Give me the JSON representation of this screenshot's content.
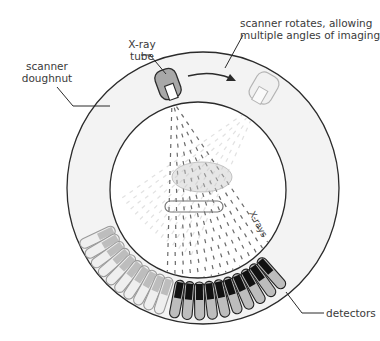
{
  "diagram": {
    "labels": {
      "xray_tube": [
        "X-ray",
        "tube"
      ],
      "scanner_doughnut": [
        "scanner",
        "doughnut"
      ],
      "rotation_note": [
        "scanner rotates, allowing",
        "multiple angles of imaging"
      ],
      "xrays": "X-rays",
      "detectors": "detectors"
    },
    "components": [
      {
        "id": "outer-ring",
        "type": "doughnut",
        "center": [
          203,
          188
        ],
        "radius": 136
      },
      {
        "id": "inner-bore",
        "type": "circle",
        "center": [
          198,
          190
        ],
        "radius": 88
      },
      {
        "id": "xray-tube",
        "state": "current",
        "position": [
          168,
          84
        ]
      },
      {
        "id": "xray-tube-ghost",
        "state": "rotated",
        "position": [
          264,
          88
        ]
      },
      {
        "id": "rotation-arrow",
        "direction": "clockwise"
      },
      {
        "id": "xray-fan-beam",
        "state": "current"
      },
      {
        "id": "xray-fan-beam-ghost",
        "state": "rotated"
      },
      {
        "id": "patient-body",
        "shape": "ellipse"
      },
      {
        "id": "patient-table",
        "shape": "rounded-bar"
      },
      {
        "id": "detector-array",
        "state": "current",
        "count": 10
      },
      {
        "id": "detector-array-ghost",
        "state": "rotated",
        "count": 10
      }
    ],
    "colors": {
      "ring_fill": "#f3f3f3",
      "outline": "#2b2b2b",
      "tube_fill": "#a8a8a8",
      "ghost": "#b8b8b8",
      "detector_dark": "#111111",
      "detector_light": "#bdbdbd",
      "beam": "#6a6a6a",
      "ghost_beam": "#cfcfcf"
    }
  }
}
